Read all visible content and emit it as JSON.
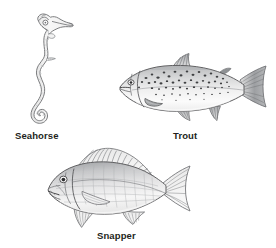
{
  "plate": {
    "kind": "fish-species-illustration-plate",
    "background_color": "#ffffff",
    "ink_color": "#231f20",
    "line_color": "#58595b",
    "fill_light": "#f2f2f2",
    "fill_mid": "#d9d9d9",
    "fill_dark": "#a7a9ac",
    "figures": [
      {
        "id": "seahorse",
        "label": "Seahorse",
        "orientation": "vertical",
        "facing": "right",
        "body_fill": "#f4f4f4",
        "features": "long snout, crowned head, curled prehensile tail, dorsal fin, pectoral fin"
      },
      {
        "id": "trout",
        "label": "Trout",
        "orientation": "horizontal",
        "facing": "left",
        "body_fill": "#efefef",
        "features": "spotted back and flank, adipose fin, forked caudal fin, dorsal fin, pelvic and anal fins"
      },
      {
        "id": "snapper",
        "label": "Snapper",
        "orientation": "horizontal",
        "facing": "left",
        "body_fill": "#e9e9e9",
        "features": "deep body, spiny dorsal fin, forked caudal fin, large eye, pointed snout, pectoral fin"
      }
    ]
  },
  "captions": {
    "seahorse": "Seahorse",
    "trout": "Trout",
    "snapper": "Snapper"
  }
}
